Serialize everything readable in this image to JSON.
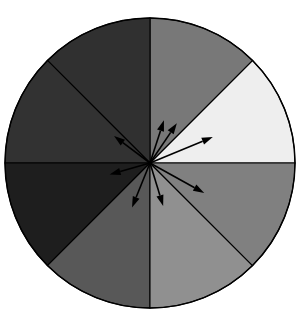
{
  "figure": {
    "background_color": "#ffffff",
    "outline_color": "#000000"
  },
  "chart_data": {
    "type": "pie",
    "title": "",
    "subtitle": "",
    "xlabel": "",
    "ylabel": "",
    "legend_position": "none",
    "grid": false,
    "center": {
      "x": 150,
      "y": 163
    },
    "radius": 145,
    "slice_count": 8,
    "slice_angle_degrees": 45,
    "categories": [
      "0-45",
      "45-90",
      "90-135",
      "135-180",
      "180-225",
      "225-270",
      "270-315",
      "315-360"
    ],
    "values": [
      45,
      45,
      45,
      45,
      45,
      45,
      45,
      45
    ],
    "sectors": [
      {
        "index": 0,
        "label": "0-45",
        "start_deg": 0,
        "end_deg": 45,
        "color": "#eeeeee",
        "brightness": 238
      },
      {
        "index": 1,
        "label": "45-90",
        "start_deg": 45,
        "end_deg": 90,
        "color": "#787878",
        "brightness": 120
      },
      {
        "index": 2,
        "label": "90-135",
        "start_deg": 90,
        "end_deg": 135,
        "color": "#303030",
        "brightness": 48
      },
      {
        "index": 3,
        "label": "135-180",
        "start_deg": 135,
        "end_deg": 180,
        "color": "#323232",
        "brightness": 50
      },
      {
        "index": 4,
        "label": "180-225",
        "start_deg": 180,
        "end_deg": 225,
        "color": "#1e1e1e",
        "brightness": 30
      },
      {
        "index": 5,
        "label": "225-270",
        "start_deg": 225,
        "end_deg": 270,
        "color": "#585858",
        "brightness": 88
      },
      {
        "index": 6,
        "label": "270-315",
        "start_deg": 270,
        "end_deg": 315,
        "color": "#909090",
        "brightness": 144
      },
      {
        "index": 7,
        "label": "315-360",
        "start_deg": 315,
        "end_deg": 360,
        "color": "#808080",
        "brightness": 128
      }
    ],
    "arrows": [
      {
        "index": 0,
        "label": "arrow-22deg",
        "angle_deg": 22.5,
        "length": 68,
        "color": "#000000"
      },
      {
        "index": 1,
        "label": "arrow-45deg",
        "angle_deg": 56,
        "length": 48,
        "color": "#000000"
      },
      {
        "index": 2,
        "label": "arrow-70deg",
        "angle_deg": 72,
        "length": 45,
        "color": "#000000"
      },
      {
        "index": 3,
        "label": "arrow-140deg",
        "angle_deg": 143,
        "length": 45,
        "color": "#000000"
      },
      {
        "index": 4,
        "label": "arrow-196deg",
        "angle_deg": 196,
        "length": 42,
        "color": "#000000"
      },
      {
        "index": 5,
        "label": "arrow-248deg",
        "angle_deg": 248,
        "length": 48,
        "color": "#000000"
      },
      {
        "index": 6,
        "label": "arrow-287deg",
        "angle_deg": 287,
        "length": 45,
        "color": "#000000"
      },
      {
        "index": 7,
        "label": "arrow-331deg",
        "angle_deg": 331,
        "length": 62,
        "color": "#000000"
      }
    ]
  }
}
